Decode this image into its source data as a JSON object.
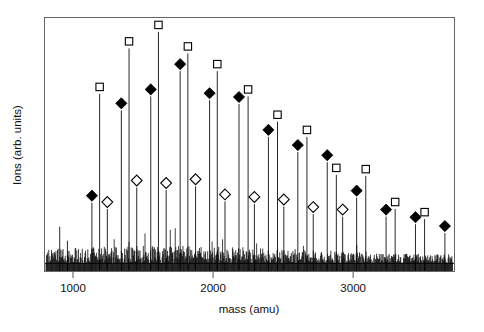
{
  "chart_data": {
    "type": "line",
    "title": "",
    "subtitle": "",
    "xlabel": "mass (amu)",
    "ylabel": "Ions (arb. units)",
    "xlim": [
      800,
      3720
    ],
    "ylim": [
      0,
      1.0
    ],
    "grid": false,
    "legend": null,
    "xticks": [
      1000,
      2000,
      3000
    ],
    "xtick_labels": [
      "1000",
      "2000",
      "3000"
    ],
    "yticks": [],
    "ytick_labels": [],
    "annotations": [],
    "marker_series": [
      {
        "name": "open-square-series",
        "marker": "open-square",
        "points": [
          {
            "x": 1190,
            "y": 0.7
          },
          {
            "x": 1400,
            "y": 0.88
          },
          {
            "x": 1610,
            "y": 0.945
          },
          {
            "x": 1820,
            "y": 0.86
          },
          {
            "x": 2030,
            "y": 0.79
          },
          {
            "x": 2250,
            "y": 0.69
          },
          {
            "x": 2460,
            "y": 0.59
          },
          {
            "x": 2670,
            "y": 0.53
          },
          {
            "x": 2880,
            "y": 0.38
          },
          {
            "x": 3090,
            "y": 0.375
          },
          {
            "x": 3300,
            "y": 0.245
          },
          {
            "x": 3510,
            "y": 0.205
          }
        ]
      },
      {
        "name": "filled-diamond-series",
        "marker": "filled-diamond",
        "points": [
          {
            "x": 1135,
            "y": 0.27
          },
          {
            "x": 1345,
            "y": 0.635
          },
          {
            "x": 1555,
            "y": 0.69
          },
          {
            "x": 1765,
            "y": 0.79
          },
          {
            "x": 1975,
            "y": 0.675
          },
          {
            "x": 2185,
            "y": 0.66
          },
          {
            "x": 2395,
            "y": 0.53
          },
          {
            "x": 2605,
            "y": 0.47
          },
          {
            "x": 2815,
            "y": 0.43
          },
          {
            "x": 3025,
            "y": 0.29
          },
          {
            "x": 3235,
            "y": 0.215
          },
          {
            "x": 3445,
            "y": 0.185
          },
          {
            "x": 3655,
            "y": 0.15
          }
        ]
      },
      {
        "name": "open-diamond-series",
        "marker": "open-diamond",
        "points": [
          {
            "x": 1245,
            "y": 0.245
          },
          {
            "x": 1455,
            "y": 0.33
          },
          {
            "x": 1665,
            "y": 0.32
          },
          {
            "x": 1875,
            "y": 0.335
          },
          {
            "x": 2085,
            "y": 0.275
          },
          {
            "x": 2295,
            "y": 0.265
          },
          {
            "x": 2505,
            "y": 0.255
          },
          {
            "x": 2715,
            "y": 0.225
          },
          {
            "x": 2925,
            "y": 0.215
          }
        ]
      }
    ],
    "stems": [
      {
        "x": 1135,
        "y": 0.27
      },
      {
        "x": 1190,
        "y": 0.7
      },
      {
        "x": 1245,
        "y": 0.245
      },
      {
        "x": 1345,
        "y": 0.635
      },
      {
        "x": 1400,
        "y": 0.88
      },
      {
        "x": 1455,
        "y": 0.33
      },
      {
        "x": 1555,
        "y": 0.69
      },
      {
        "x": 1610,
        "y": 0.945
      },
      {
        "x": 1665,
        "y": 0.32
      },
      {
        "x": 1765,
        "y": 0.79
      },
      {
        "x": 1820,
        "y": 0.86
      },
      {
        "x": 1875,
        "y": 0.335
      },
      {
        "x": 1975,
        "y": 0.675
      },
      {
        "x": 2030,
        "y": 0.79
      },
      {
        "x": 2085,
        "y": 0.275
      },
      {
        "x": 2185,
        "y": 0.66
      },
      {
        "x": 2250,
        "y": 0.69
      },
      {
        "x": 2295,
        "y": 0.265
      },
      {
        "x": 2395,
        "y": 0.53
      },
      {
        "x": 2460,
        "y": 0.59
      },
      {
        "x": 2505,
        "y": 0.255
      },
      {
        "x": 2605,
        "y": 0.47
      },
      {
        "x": 2670,
        "y": 0.53
      },
      {
        "x": 2715,
        "y": 0.225
      },
      {
        "x": 2815,
        "y": 0.43
      },
      {
        "x": 2880,
        "y": 0.38
      },
      {
        "x": 2925,
        "y": 0.215
      },
      {
        "x": 3025,
        "y": 0.29
      },
      {
        "x": 3090,
        "y": 0.375
      },
      {
        "x": 3235,
        "y": 0.215
      },
      {
        "x": 3300,
        "y": 0.245
      },
      {
        "x": 3445,
        "y": 0.185
      },
      {
        "x": 3510,
        "y": 0.205
      },
      {
        "x": 3655,
        "y": 0.15
      },
      {
        "x": 905,
        "y": 0.175
      },
      {
        "x": 960,
        "y": 0.12
      }
    ],
    "baseline_noise": {
      "amplitude": 0.055,
      "baseline_y": 0.03,
      "description": "dense random noise across full mass range"
    },
    "colors": {
      "line": "#000000",
      "frame": "#555555",
      "text": "#111111",
      "background": "#ffffff"
    }
  },
  "axes": {
    "xlabel": "mass (amu)",
    "ylabel": "Ions (arb. units)",
    "xtick_labels": [
      "1000",
      "2000",
      "3000"
    ]
  }
}
